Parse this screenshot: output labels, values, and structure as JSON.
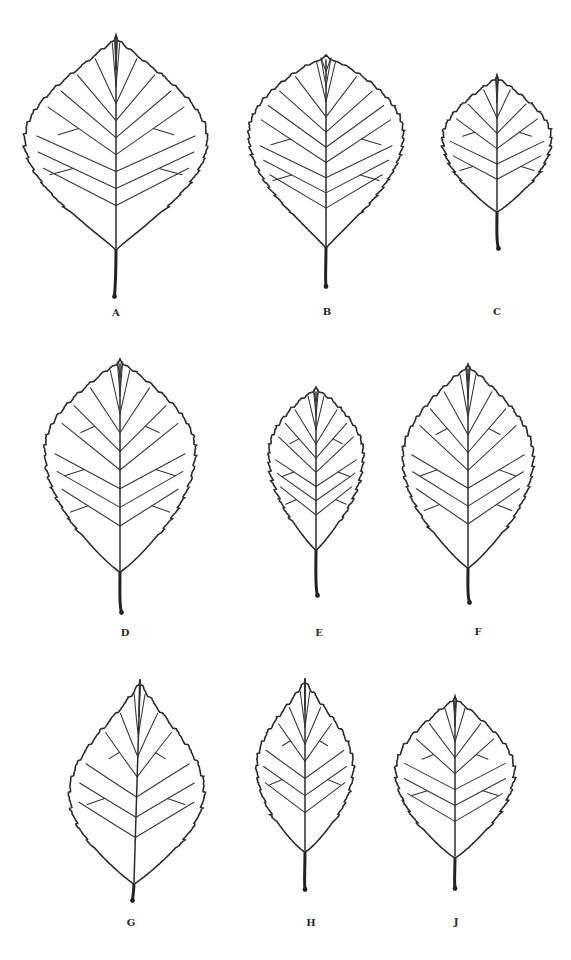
{
  "figure": {
    "leaves": [
      {
        "label": "A",
        "shape": "broadly ovate",
        "teeth": 34,
        "vein_pairs": 10
      },
      {
        "label": "B",
        "shape": "broadly elliptic-obovate",
        "teeth": 46,
        "vein_pairs": 10
      },
      {
        "label": "C",
        "shape": "ovate-rhombic",
        "teeth": 30,
        "vein_pairs": 7
      },
      {
        "label": "D",
        "shape": "elliptic",
        "teeth": 38,
        "vein_pairs": 9
      },
      {
        "label": "E",
        "shape": "narrow elliptic",
        "teeth": 34,
        "vein_pairs": 9
      },
      {
        "label": "F",
        "shape": "elliptic-ovate",
        "teeth": 38,
        "vein_pairs": 9
      },
      {
        "label": "G",
        "shape": "ovate, acute",
        "teeth": 24,
        "vein_pairs": 8
      },
      {
        "label": "H",
        "shape": "narrow ovate, acute",
        "teeth": 26,
        "vein_pairs": 8
      },
      {
        "label": "J",
        "shape": "ovate-rhombic",
        "teeth": 26,
        "vein_pairs": 8
      }
    ]
  },
  "colors": {
    "ink": "#2b2b2b",
    "paper": "#ffffff"
  }
}
